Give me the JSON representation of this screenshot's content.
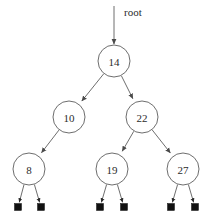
{
  "figure": {
    "kind": "binary-search-tree-diagram",
    "background_color": "#ffffff",
    "stroke_color": "#6e6e6e",
    "text_color": "#2b2b2b",
    "null_color": "#111111",
    "width": 214,
    "height": 219
  },
  "root_pointer": {
    "label": "root",
    "label_x": 124,
    "label_y": 12,
    "line_x": 114,
    "line_y_start": 6,
    "line_y_end": 44
  },
  "nodes": [
    {
      "id": "n14",
      "label": "14",
      "x": 114,
      "y": 61,
      "r": 16,
      "level": 0
    },
    {
      "id": "n10",
      "label": "10",
      "x": 69,
      "y": 117,
      "r": 16,
      "level": 1
    },
    {
      "id": "n22",
      "label": "22",
      "x": 142,
      "y": 117,
      "r": 16,
      "level": 1
    },
    {
      "id": "n8",
      "label": "8",
      "x": 29,
      "y": 169,
      "r": 16,
      "level": 2
    },
    {
      "id": "n19",
      "label": "19",
      "x": 112,
      "y": 169,
      "r": 16,
      "level": 2
    },
    {
      "id": "n27",
      "label": "27",
      "x": 183,
      "y": 169,
      "r": 16,
      "level": 2
    }
  ],
  "edges": [
    {
      "id": "e14-10",
      "from": "n14",
      "to": "n10",
      "side": "left"
    },
    {
      "id": "e14-22",
      "from": "n14",
      "to": "n22",
      "side": "right"
    },
    {
      "id": "e10-8",
      "from": "n10",
      "to": "n8",
      "side": "left"
    },
    {
      "id": "e22-19",
      "from": "n22",
      "to": "n19",
      "side": "left"
    },
    {
      "id": "e22-27",
      "from": "n22",
      "to": "n27",
      "side": "right"
    }
  ],
  "null_leaves": [
    {
      "id": "z8l",
      "parent": "n8",
      "side": "left",
      "x": 18,
      "y": 207,
      "size": 7
    },
    {
      "id": "z8r",
      "parent": "n8",
      "side": "right",
      "x": 41,
      "y": 207,
      "size": 7
    },
    {
      "id": "z19l",
      "parent": "n19",
      "side": "left",
      "x": 100,
      "y": 207,
      "size": 7
    },
    {
      "id": "z19r",
      "parent": "n19",
      "side": "right",
      "x": 124,
      "y": 207,
      "size": 7
    },
    {
      "id": "z27l",
      "parent": "n27",
      "side": "left",
      "x": 171,
      "y": 207,
      "size": 7
    },
    {
      "id": "z27r",
      "parent": "n27",
      "side": "right",
      "x": 195,
      "y": 207,
      "size": 7
    }
  ],
  "tree_structure": {
    "value": "14",
    "left": {
      "value": "10",
      "left": {
        "value": "8",
        "left": null,
        "right": null
      },
      "right": null
    },
    "right": {
      "value": "22",
      "left": {
        "value": "19",
        "left": null,
        "right": null
      },
      "right": {
        "value": "27",
        "left": null,
        "right": null
      }
    }
  }
}
